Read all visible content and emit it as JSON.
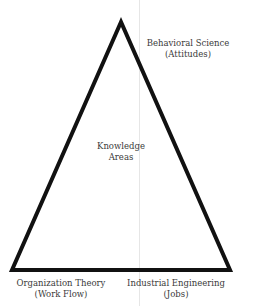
{
  "diagram": {
    "type": "triangle",
    "center": {
      "line1": "Knowledge",
      "line2": "Areas"
    },
    "vertices": {
      "top": {
        "title": "Behavioral Science",
        "subtitle": "(Attitudes)"
      },
      "bottom_left": {
        "title": "Organization Theory",
        "subtitle": "(Work Flow)"
      },
      "bottom_right": {
        "title": "Industrial Engineering",
        "subtitle": "(Jobs)"
      }
    },
    "colors": {
      "stroke": "#111111",
      "text": "#3a3a3a",
      "fold": "#e6e6e6"
    }
  }
}
